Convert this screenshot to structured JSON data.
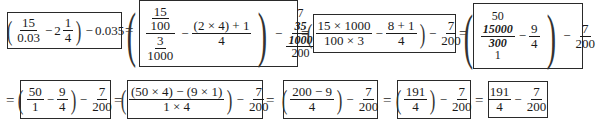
{
  "steps": [
    {
      "id": "step1",
      "a_num": "15",
      "a_den": "0.03",
      "minus": "−",
      "mixed_int": "2",
      "mixed_num": "1",
      "mixed_den": "4",
      "tail_op": "−",
      "tail": "0.035"
    },
    {
      "id": "step2",
      "inner_top_num": "15",
      "inner_top_den": "100",
      "inner_bot_num": "3",
      "inner_bot_den": "1000",
      "minus": "−",
      "b_num": "(2 × 4) + 1",
      "b_den": "4",
      "tail_op": "−",
      "c_top": "7",
      "c_inner_num": "35",
      "c_inner_den": "1000",
      "c_bot": "200"
    },
    {
      "id": "step3",
      "a_num": "15 × 1000",
      "a_den": "100 × 3",
      "minus": "−",
      "b_num": "8 + 1",
      "b_den": "4",
      "tail_op": "−",
      "c_num": "7",
      "c_den": "200"
    },
    {
      "id": "step4",
      "a_top": "50",
      "a_num": "15000",
      "a_den": "300",
      "a_bot": "1",
      "minus": "−",
      "b_num": "9",
      "b_den": "4",
      "tail_op": "−",
      "c_num": "7",
      "c_den": "200"
    },
    {
      "id": "step5",
      "a_num": "50",
      "a_den": "1",
      "minus": "−",
      "b_num": "9",
      "b_den": "4",
      "tail_op": "−",
      "c_num": "7",
      "c_den": "200"
    },
    {
      "id": "step6",
      "a_num": "(50 × 4) − (9 × 1)",
      "a_den": "1 × 4",
      "tail_op": "−",
      "c_num": "7",
      "c_den": "200"
    },
    {
      "id": "step7",
      "a_num": "200 − 9",
      "a_den": "4",
      "tail_op": "−",
      "c_num": "7",
      "c_den": "200"
    },
    {
      "id": "step8",
      "a_num": "191",
      "a_den": "4",
      "tail_op": "−",
      "c_num": "7",
      "c_den": "200"
    },
    {
      "id": "step9",
      "a_num": "191",
      "a_den": "4",
      "tail_op": "−",
      "c_num": "7",
      "c_den": "200"
    }
  ],
  "equals": "=",
  "paren_open": "(",
  "paren_close": ")"
}
